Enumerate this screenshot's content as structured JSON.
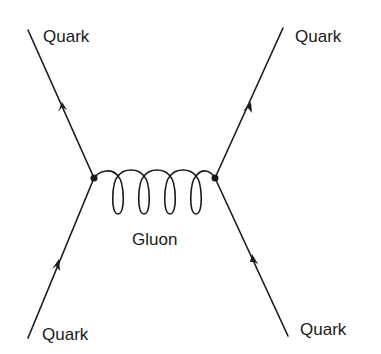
{
  "diagram": {
    "type": "feynman-diagram",
    "labels": {
      "top_left": "Quark",
      "top_right": "Quark",
      "bottom_left": "Quark",
      "bottom_right": "Quark",
      "propagator": "Gluon"
    },
    "vertices": [
      {
        "id": "left-vertex",
        "x": 94,
        "y": 178
      },
      {
        "id": "right-vertex",
        "x": 215,
        "y": 178
      }
    ],
    "edges": [
      {
        "id": "quark-in-left",
        "from": [
          28,
          338
        ],
        "to": [
          94,
          178
        ],
        "arrow": "toward-vertex"
      },
      {
        "id": "quark-out-left",
        "from": [
          94,
          178
        ],
        "to": [
          28,
          30
        ],
        "arrow": "away-from-vertex"
      },
      {
        "id": "quark-in-right",
        "from": [
          288,
          336
        ],
        "to": [
          215,
          178
        ],
        "arrow": "toward-vertex"
      },
      {
        "id": "quark-out-right",
        "from": [
          215,
          178
        ],
        "to": [
          283,
          28
        ],
        "arrow": "away-from-vertex"
      },
      {
        "id": "gluon",
        "from": [
          94,
          178
        ],
        "to": [
          215,
          178
        ],
        "style": "curly",
        "loops": 4
      }
    ],
    "colors": {
      "ink": "#1a1a1a",
      "background": "#ffffff"
    }
  }
}
